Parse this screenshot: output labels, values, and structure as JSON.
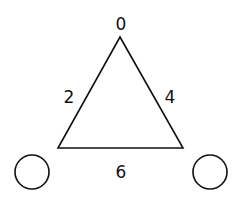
{
  "diagram": {
    "type": "graph",
    "stroke_color": "#111111",
    "background": "#ffffff",
    "triangle": {
      "vertices": [
        [
          120,
          37
        ],
        [
          58,
          148
        ],
        [
          183,
          148
        ]
      ]
    },
    "labels": {
      "top": "0",
      "left": "2",
      "right": "4",
      "bottom": "6"
    },
    "circles": [
      {
        "name": "left-circle",
        "cx": 32,
        "cy": 172,
        "r": 17
      },
      {
        "name": "right-circle",
        "cx": 210,
        "cy": 172,
        "r": 17
      }
    ]
  }
}
